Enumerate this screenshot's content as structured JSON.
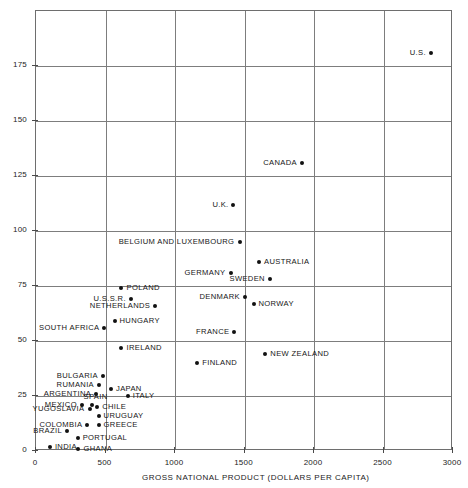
{
  "chart_data": {
    "type": "scatter",
    "title": "",
    "xlabel": "GROSS NATIONAL PRODUCT (DOLLARS PER CAPITA)",
    "ylabel": "",
    "xlim": [
      0,
      3000
    ],
    "ylim": [
      0,
      200
    ],
    "xticks": [
      0,
      500,
      1000,
      1500,
      2000,
      2500,
      3000
    ],
    "xtick_labels": [
      "0",
      "500",
      "1000",
      "1500",
      "2000",
      "2500",
      "3000"
    ],
    "yticks": [
      0,
      25,
      50,
      75,
      100,
      125,
      150,
      175
    ],
    "ytick_labels": [
      "0",
      "25",
      "50",
      "75",
      "100",
      "125",
      "150",
      "175"
    ],
    "grid": true,
    "legend": "none",
    "points": [
      {
        "label": "U.S.",
        "x": 2840,
        "y": 181,
        "side": "left"
      },
      {
        "label": "CANADA",
        "x": 1915,
        "y": 131,
        "side": "left"
      },
      {
        "label": "U.K.",
        "x": 1420,
        "y": 112,
        "side": "left"
      },
      {
        "label": "BELGIUM AND LUXEMBOURG",
        "x": 1465,
        "y": 95,
        "side": "left"
      },
      {
        "label": "AUSTRALIA",
        "x": 1605,
        "y": 86,
        "side": "right"
      },
      {
        "label": "GERMANY",
        "x": 1400,
        "y": 81,
        "side": "left"
      },
      {
        "label": "SWEDEN",
        "x": 1680,
        "y": 78,
        "side": "left"
      },
      {
        "label": "POLAND",
        "x": 615,
        "y": 74,
        "side": "right"
      },
      {
        "label": "DENMARK",
        "x": 1500,
        "y": 70,
        "side": "left"
      },
      {
        "label": "U.S.S.R.",
        "x": 680,
        "y": 69,
        "side": "left"
      },
      {
        "label": "NORWAY",
        "x": 1565,
        "y": 67,
        "side": "right"
      },
      {
        "label": "NETHERLANDS",
        "x": 855,
        "y": 66,
        "side": "left"
      },
      {
        "label": "HUNGARY",
        "x": 565,
        "y": 59,
        "side": "right"
      },
      {
        "label": "SOUTH AFRICA",
        "x": 490,
        "y": 56,
        "side": "left"
      },
      {
        "label": "FRANCE",
        "x": 1425,
        "y": 54,
        "side": "left"
      },
      {
        "label": "IRELAND",
        "x": 615,
        "y": 47,
        "side": "right"
      },
      {
        "label": "NEW ZEALAND",
        "x": 1650,
        "y": 44,
        "side": "right"
      },
      {
        "label": "FINLAND",
        "x": 1160,
        "y": 40,
        "side": "right"
      },
      {
        "label": "BULGARIA",
        "x": 480,
        "y": 34,
        "side": "left"
      },
      {
        "label": "RUMANIA",
        "x": 450,
        "y": 30,
        "side": "left"
      },
      {
        "label": "JAPAN",
        "x": 540,
        "y": 28,
        "side": "right"
      },
      {
        "label": "ARGENTINA",
        "x": 430,
        "y": 26,
        "side": "left"
      },
      {
        "label": "ITALY",
        "x": 660,
        "y": 25,
        "side": "right"
      },
      {
        "label": "SPAIN",
        "x": 400,
        "y": 21,
        "side": "above"
      },
      {
        "label": "MEXICO",
        "x": 330,
        "y": 21,
        "side": "left"
      },
      {
        "label": "CHILE",
        "x": 440,
        "y": 20,
        "side": "right"
      },
      {
        "label": "YUGOSLAVIA",
        "x": 385,
        "y": 19,
        "side": "left"
      },
      {
        "label": "URUGUAY",
        "x": 450,
        "y": 16,
        "side": "right"
      },
      {
        "label": "COLOMBIA",
        "x": 370,
        "y": 12,
        "side": "left"
      },
      {
        "label": "GREECE",
        "x": 450,
        "y": 12,
        "side": "right"
      },
      {
        "label": "BRAZIL",
        "x": 225,
        "y": 9,
        "side": "left"
      },
      {
        "label": "PORTUGAL",
        "x": 300,
        "y": 6,
        "side": "right"
      },
      {
        "label": "INDIA",
        "x": 100,
        "y": 2,
        "side": "right"
      },
      {
        "label": "GHANA",
        "x": 305,
        "y": 1,
        "side": "right"
      }
    ]
  },
  "axes": {
    "x_title": "GROSS NATIONAL PRODUCT (DOLLARS PER CAPITA)"
  },
  "colors": {
    "point": "#111111",
    "grid": "#7d7d7d",
    "frame": "#6e6e6e",
    "text": "#161616",
    "background": "#ffffff"
  }
}
